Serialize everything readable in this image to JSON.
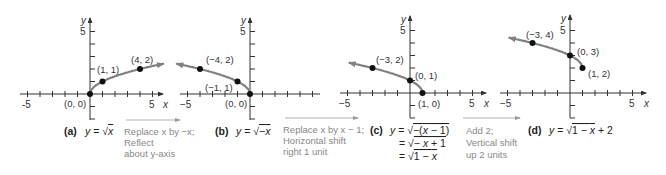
{
  "colors": {
    "axis": "#333333",
    "curve": "#808080",
    "point": "#111111",
    "step_text": "#888888"
  },
  "chart_data": [
    {
      "id": "a",
      "type": "line",
      "tag": "(a)",
      "equation": [
        "y = √x"
      ],
      "xlabel": "x",
      "ylabel": "y",
      "xlim": [
        -5,
        5
      ],
      "ylim": [
        -2,
        5
      ],
      "x_tick_labels": [
        "-5",
        "5"
      ],
      "y_tick_labels": [
        "5"
      ],
      "curve": {
        "function": "sqrt(x)",
        "domain": [
          0,
          5.9
        ],
        "arrow": "right"
      },
      "points": [
        {
          "x": 0,
          "y": 0,
          "label": "(0, 0)"
        },
        {
          "x": 1,
          "y": 1,
          "label": "(1, 1)"
        },
        {
          "x": 4,
          "y": 2,
          "label": "(4, 2)"
        }
      ]
    },
    {
      "id": "b",
      "type": "line",
      "tag": "(b)",
      "equation": [
        "y = √−x"
      ],
      "xlabel": "x",
      "ylabel": "y",
      "xlim": [
        -5,
        5
      ],
      "ylim": [
        -2,
        5
      ],
      "x_tick_labels": [
        "−5",
        "5"
      ],
      "y_tick_labels": [
        "5"
      ],
      "curve": {
        "function": "sqrt(-x)",
        "domain": [
          -5.9,
          0
        ],
        "arrow": "left"
      },
      "points": [
        {
          "x": 0,
          "y": 0,
          "label": "(0, 0)"
        },
        {
          "x": -1,
          "y": 1,
          "label": "(−1, 1)"
        },
        {
          "x": -4,
          "y": 2,
          "label": "(−4, 2)"
        }
      ]
    },
    {
      "id": "c",
      "type": "line",
      "tag": "(c)",
      "equation": [
        "y = √−(x − 1)",
        "= √− x + 1",
        "= √1 − x"
      ],
      "xlabel": "x",
      "ylabel": "y",
      "xlim": [
        -5,
        5
      ],
      "ylim": [
        -2,
        5
      ],
      "x_tick_labels": [
        "−5",
        "5"
      ],
      "y_tick_labels": [
        "5"
      ],
      "curve": {
        "function": "sqrt(1-x)",
        "domain": [
          -4.9,
          1
        ],
        "arrow": "left"
      },
      "points": [
        {
          "x": 1,
          "y": 0,
          "label": "(1, 0)"
        },
        {
          "x": 0,
          "y": 1,
          "label": "(0, 1)"
        },
        {
          "x": -3,
          "y": 2,
          "label": "(−3, 2)"
        }
      ]
    },
    {
      "id": "d",
      "type": "line",
      "tag": "(d)",
      "equation": [
        "y = √1 − x + 2"
      ],
      "xlabel": "x",
      "ylabel": "y",
      "xlim": [
        -5,
        5
      ],
      "ylim": [
        -2,
        5
      ],
      "x_tick_labels": [
        "−5",
        "5"
      ],
      "y_tick_labels": [
        "5"
      ],
      "curve": {
        "function": "sqrt(1-x)+2",
        "domain": [
          -4.9,
          1
        ],
        "arrow": "left"
      },
      "points": [
        {
          "x": 1,
          "y": 2,
          "label": "(1, 2)"
        },
        {
          "x": 0,
          "y": 3,
          "label": "(0, 3)"
        },
        {
          "x": -3,
          "y": 4,
          "label": "(−3, 4)"
        }
      ]
    }
  ],
  "steps": [
    {
      "lines": [
        "Replace x by −x;",
        "Reflect",
        "about y-axis"
      ]
    },
    {
      "lines": [
        "Replace x by x − 1;",
        "Horizontal shift",
        "right 1 unit"
      ]
    },
    {
      "lines": [
        "Add 2;",
        "Vertical shift",
        "up 2 units"
      ]
    }
  ]
}
